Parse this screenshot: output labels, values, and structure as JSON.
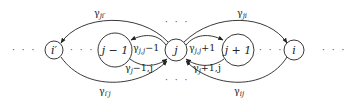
{
  "diagram": {
    "type": "state-transition graph",
    "nodes": [
      {
        "id": "i_prime",
        "label": "i′",
        "cx": 54,
        "cy": 50,
        "r": 9
      },
      {
        "id": "j_minus_1",
        "label": "j − 1",
        "cx": 115,
        "cy": 50,
        "r": 17
      },
      {
        "id": "j",
        "label": "j",
        "cx": 176,
        "cy": 50,
        "r": 11
      },
      {
        "id": "j_plus_1",
        "label": "j + 1",
        "cx": 238,
        "cy": 50,
        "r": 16
      },
      {
        "id": "i",
        "label": "i",
        "cx": 294,
        "cy": 50,
        "r": 10
      }
    ],
    "ellipses": [
      {
        "id": "dots-left",
        "text": "· · ·",
        "x": 12,
        "y": 53
      },
      {
        "id": "dots-i-prime-j-minus-1",
        "text": "· · ·",
        "x": 70,
        "y": 53
      },
      {
        "id": "dots-above-j",
        "text": "· · ·",
        "x": 165,
        "y": 25
      },
      {
        "id": "dots-below-j",
        "text": "· · ·",
        "x": 165,
        "y": 83
      },
      {
        "id": "dots-j-plus-1-i",
        "text": "· · ·",
        "x": 260,
        "y": 53
      },
      {
        "id": "dots-right",
        "text": "· · ·",
        "x": 322,
        "y": 53
      }
    ],
    "edges": [
      {
        "from": "j",
        "to": "i_prime",
        "label": "γ",
        "sub": "ji′",
        "lx": 95,
        "ly": 15
      },
      {
        "from": "i_prime",
        "to": "j",
        "label": "γ",
        "sub": "i′j",
        "lx": 100,
        "ly": 93
      },
      {
        "from": "j",
        "to": "i",
        "label": "γ",
        "sub": "ji",
        "lx": 237,
        "ly": 15
      },
      {
        "from": "i",
        "to": "j",
        "label": "γ",
        "sub": "ij",
        "lx": 235,
        "ly": 93
      },
      {
        "from": "j",
        "to": "j_minus_1",
        "label": "γ",
        "sub": "j,j−1",
        "lx": 133,
        "ly": 50
      },
      {
        "from": "j_minus_1",
        "to": "j",
        "label": "γ",
        "sub": "j−1,j",
        "lx": 124,
        "ly": 70
      },
      {
        "from": "j",
        "to": "j_plus_1",
        "label": "γ",
        "sub": "j,j+1",
        "lx": 190,
        "ly": 50
      },
      {
        "from": "j_plus_1",
        "to": "j",
        "label": "γ",
        "sub": "j+1,j",
        "lx": 193,
        "ly": 70
      }
    ]
  },
  "labels": {
    "node_i_prime": "i′",
    "node_j_minus_1": "j − 1",
    "node_j": "j",
    "node_j_plus_1": "j + 1",
    "node_i": "i",
    "gamma": "γ",
    "sub_ji_prime": "ji′",
    "sub_i_prime_j": "i′j",
    "sub_ji": "ji",
    "sub_ij": "ij",
    "sub_j_jm1": "j,j",
    "sub_j_jm1_tail": "−1",
    "sub_jm1_j": "j",
    "sub_jm1_j_tail": "−1,j",
    "sub_j_jp1": "j,j",
    "sub_j_jp1_tail": "+1",
    "sub_jp1_j": "j",
    "sub_jp1_j_tail": "+1,j",
    "dots": "· · ·"
  }
}
